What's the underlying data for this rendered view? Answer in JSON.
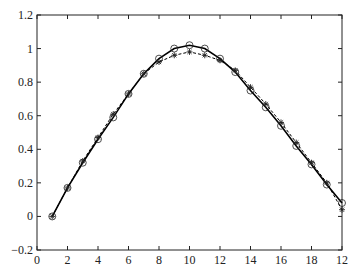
{
  "chart_data": {
    "type": "line",
    "title": "",
    "xlabel": "",
    "ylabel": "",
    "xlim": [
      0,
      20
    ],
    "ylim": [
      -0.2,
      1.2
    ],
    "grid": false,
    "legend": null,
    "x_tick_labels": [
      "0",
      "2",
      "4",
      "6",
      "8",
      "10",
      "12",
      "14",
      "16",
      "18",
      "12"
    ],
    "y_tick_labels": [
      "-0.2",
      "0",
      "0.2",
      "0.4",
      "0.6",
      "0.8",
      "1",
      "1.2"
    ],
    "x": [
      1,
      2,
      3,
      4,
      5,
      6,
      7,
      8,
      9,
      10,
      11,
      12,
      13,
      14,
      15,
      16,
      17,
      18,
      19,
      20
    ],
    "series": [
      {
        "name": "solid-circle",
        "line_style": "solid",
        "marker": "circle",
        "color": "#000000",
        "values": [
          0,
          0.17,
          0.32,
          0.46,
          0.59,
          0.73,
          0.85,
          0.94,
          1.0,
          1.02,
          1.0,
          0.94,
          0.86,
          0.75,
          0.65,
          0.54,
          0.42,
          0.31,
          0.19,
          0.08
        ]
      },
      {
        "name": "dashed-star",
        "line_style": "dashed",
        "marker": "star",
        "color": "#000000",
        "values": [
          0,
          0.17,
          0.33,
          0.47,
          0.61,
          0.73,
          0.85,
          0.92,
          0.96,
          0.98,
          0.96,
          0.93,
          0.87,
          0.77,
          0.67,
          0.56,
          0.44,
          0.32,
          0.2,
          0.04
        ]
      }
    ]
  }
}
